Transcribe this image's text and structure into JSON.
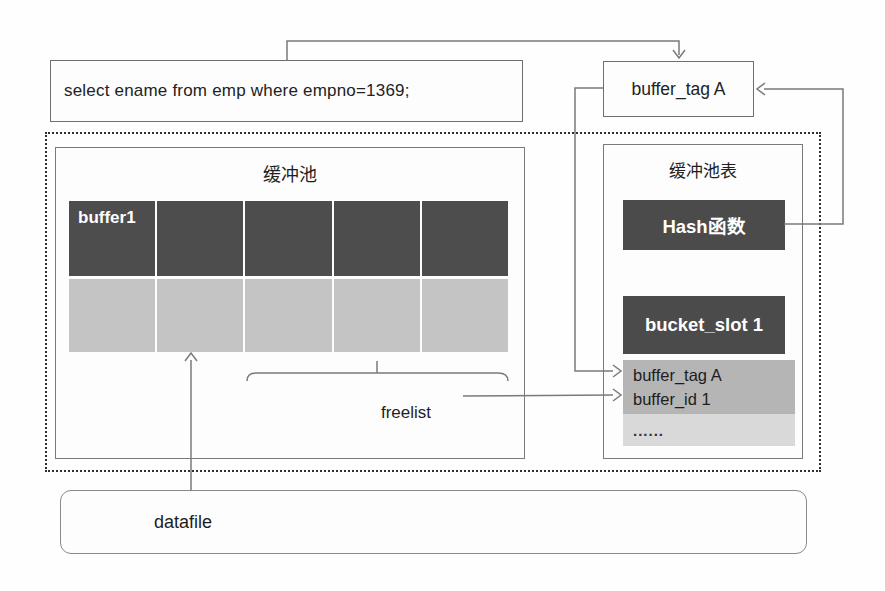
{
  "sql_box": {
    "text": "select ename from emp where empno=1369;"
  },
  "buffer_tag_box": {
    "text": "buffer_tag A"
  },
  "buffer_pool": {
    "title": "缓冲池",
    "first_cell_label": "buffer1",
    "columns": 5,
    "rows": [
      "dark",
      "light"
    ],
    "dark_row_color": "#4d4d4d",
    "light_row_color": "#c4c4c4"
  },
  "freelist": {
    "label": "freelist"
  },
  "buffer_table": {
    "title": "缓冲池表",
    "hash_label": "Hash函数",
    "bucket_label": "bucket_slot 1",
    "entry_line1": "buffer_tag A",
    "entry_line2": "buffer_id 1",
    "more_label": "......",
    "dark_color": "#4b4b4b",
    "entry_color": "#b5b5b5",
    "more_color": "#d9d9d9"
  },
  "datafile_box": {
    "label": "datafile"
  },
  "line_color": "#7a7a7a"
}
